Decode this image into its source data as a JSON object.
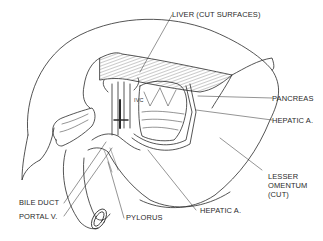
{
  "figure": {
    "type": "anatomical line illustration",
    "labels": {
      "liver": "LIVER (CUT SURFACES)",
      "pancreas": "PANCREAS",
      "hepatic_a_right": "HEPATIC A.",
      "lesser_omentum_1": "LESSER",
      "lesser_omentum_2": "OMENTUM",
      "lesser_omentum_3": "(CUT)",
      "hepatic_a_bottom": "HEPATIC A.",
      "pylorus": "PYLORUS",
      "bile_duct": "BILE DUCT",
      "portal_v": "PORTAL V.",
      "ivc": "IVC"
    },
    "colors": {
      "line": "#2a2a2a",
      "background": "#ffffff",
      "hatch": "#555555"
    }
  }
}
